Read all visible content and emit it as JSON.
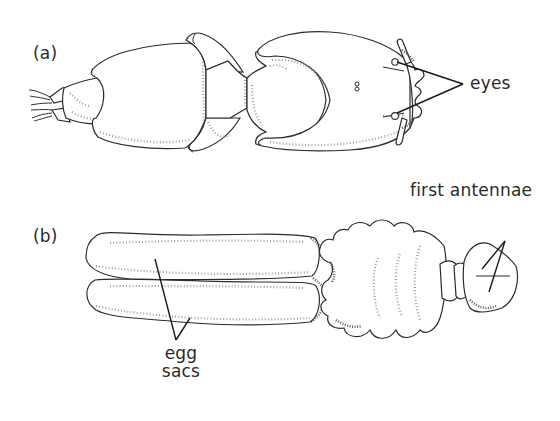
{
  "figure": {
    "panels": [
      {
        "id": "a",
        "label": "(a)",
        "annotations": [
          {
            "text": "eyes",
            "target": "eyes"
          }
        ]
      },
      {
        "id": "b",
        "label": "(b)",
        "annotations": [
          {
            "text": "first antennae",
            "target": "first-antennae"
          },
          {
            "text_lines": [
              "egg",
              "sacs"
            ],
            "target": "egg-sacs"
          }
        ]
      }
    ]
  },
  "labels": {
    "panel_a": "(a)",
    "panel_b": "(b)",
    "eyes": "eyes",
    "first_antennae": "first antennae",
    "egg": "egg",
    "sacs": "sacs"
  },
  "colors": {
    "background": "#ffffff",
    "ink": "#2b2b2b",
    "stipple": "#8a8a8a"
  }
}
